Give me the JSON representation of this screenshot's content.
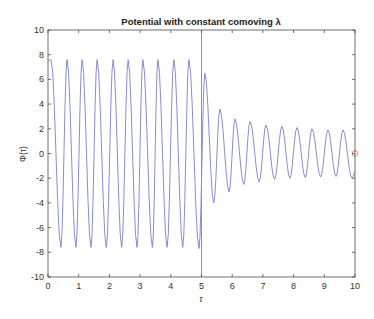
{
  "chart_data": {
    "type": "line",
    "title": "Potential with constant comoving λ",
    "xlabel": "τ",
    "ylabel": "Φ(τ)",
    "xlim": [
      0,
      10
    ],
    "ylim": [
      -10,
      10
    ],
    "xticks": [
      0,
      1,
      2,
      3,
      4,
      5,
      6,
      7,
      8,
      9,
      10
    ],
    "yticks": [
      -10,
      -8,
      -6,
      -4,
      -2,
      0,
      2,
      4,
      6,
      8,
      10
    ],
    "grid": false,
    "legend": null,
    "series": [
      {
        "name": "Phi(tau)",
        "color": "#7b7fd0",
        "description": "Oscillation with period ~0.5; constant amplitude ~7.6 for tau<5, then damped toward amplitude ~1.8",
        "extrema": [
          [
            0.0,
            7.5
          ],
          [
            0.1,
            7.6
          ],
          [
            0.42,
            -7.6
          ],
          [
            0.62,
            7.6
          ],
          [
            0.91,
            -7.6
          ],
          [
            1.11,
            7.6
          ],
          [
            1.4,
            -7.6
          ],
          [
            1.6,
            7.6
          ],
          [
            1.9,
            -7.6
          ],
          [
            2.12,
            7.6
          ],
          [
            2.4,
            -7.6
          ],
          [
            2.61,
            7.6
          ],
          [
            2.9,
            -7.6
          ],
          [
            3.09,
            7.6
          ],
          [
            3.4,
            -7.6
          ],
          [
            3.58,
            7.6
          ],
          [
            3.88,
            -7.6
          ],
          [
            4.1,
            7.6
          ],
          [
            4.39,
            -7.6
          ],
          [
            4.59,
            7.6
          ],
          [
            4.92,
            -7.7
          ],
          [
            5.11,
            6.5
          ],
          [
            5.4,
            -4.0
          ],
          [
            5.6,
            3.6
          ],
          [
            5.9,
            -3.1
          ],
          [
            6.09,
            2.8
          ],
          [
            6.38,
            -2.5
          ],
          [
            6.58,
            2.6
          ],
          [
            6.88,
            -2.3
          ],
          [
            7.1,
            2.3
          ],
          [
            7.38,
            -2.1
          ],
          [
            7.62,
            2.2
          ],
          [
            7.88,
            -2.0
          ],
          [
            8.11,
            2.1
          ],
          [
            8.38,
            -1.95
          ],
          [
            8.6,
            2.0
          ],
          [
            8.88,
            -1.9
          ],
          [
            9.12,
            1.9
          ],
          [
            9.38,
            -1.85
          ],
          [
            9.61,
            1.9
          ],
          [
            9.9,
            -2.0
          ],
          [
            10.0,
            -1.5
          ]
        ]
      }
    ],
    "annotations": [
      {
        "type": "vertical-line",
        "x": 5,
        "color": "#e8745a"
      },
      {
        "type": "circle-marker",
        "x": 10,
        "y": 0,
        "color": "#e8745a"
      }
    ]
  }
}
